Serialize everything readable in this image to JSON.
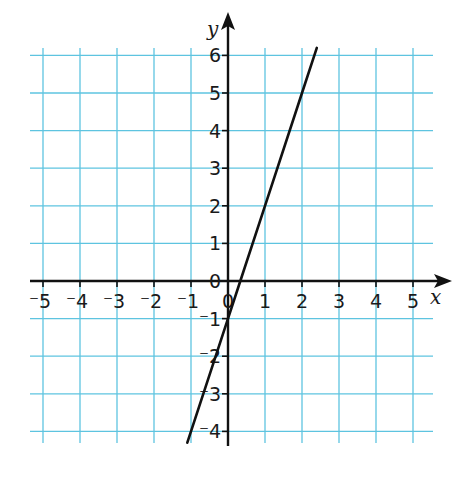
{
  "chart_data": {
    "type": "line",
    "title": "",
    "xlabel": "x",
    "ylabel": "y",
    "xlim": [
      -5.5,
      5.5
    ],
    "ylim": [
      -4.3,
      6.2
    ],
    "grid": true,
    "x_ticks": [
      -5,
      -4,
      -3,
      -2,
      -1,
      0,
      1,
      2,
      3,
      4,
      5
    ],
    "y_ticks": [
      -4,
      -3,
      -2,
      -1,
      0,
      1,
      2,
      3,
      4,
      5,
      6
    ],
    "x_tick_labels": [
      "⁻5",
      "⁻4",
      "⁻3",
      "⁻2",
      "⁻1",
      "0",
      "1",
      "2",
      "3",
      "4",
      "5"
    ],
    "y_tick_labels": [
      "⁻4",
      "⁻3",
      "⁻2",
      "⁻1",
      "0",
      "1",
      "2",
      "3",
      "4",
      "5",
      "6"
    ],
    "series": [
      {
        "name": "y = 3x - 1",
        "x": [
          -1.1,
          0,
          0.333,
          1,
          2,
          2.4
        ],
        "values": [
          -4.3,
          -1,
          0,
          2,
          5,
          6.2
        ]
      }
    ]
  },
  "colors": {
    "grid": "#5ec4e0",
    "axis": "#111111",
    "line": "#111111"
  }
}
